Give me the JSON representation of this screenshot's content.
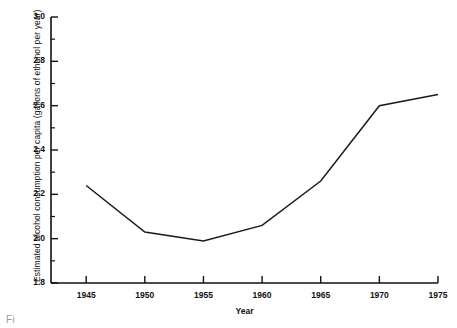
{
  "chart_data": {
    "type": "line",
    "title": "",
    "xlabel": "Year",
    "ylabel": "Estimated alcohol consumption per capita (gallons of ethanol per year)",
    "x": [
      1945,
      1950,
      1955,
      1960,
      1965,
      1970,
      1975
    ],
    "values": [
      2.24,
      2.03,
      1.99,
      2.06,
      2.26,
      2.6,
      2.65
    ],
    "xlim": [
      1942,
      1975
    ],
    "ylim": [
      1.8,
      3.0
    ],
    "xticks": [
      1945,
      1950,
      1955,
      1960,
      1965,
      1970,
      1975
    ],
    "xtick_labels": [
      "1945",
      "1950",
      "1955",
      "1960",
      "1965",
      "1970",
      "1975"
    ],
    "yticks": [
      1.8,
      2.0,
      2.2,
      2.4,
      2.6,
      2.8,
      3.0
    ],
    "ytick_labels": [
      "1.8",
      "2.0",
      "2.2",
      "2.4",
      "2.6",
      "2.8",
      "3.0"
    ],
    "y_minor_ticks": [
      1.9,
      2.1,
      2.3,
      2.5,
      2.7,
      2.9
    ],
    "grid": false,
    "legend": false,
    "line_color": "#1a1a1a",
    "axis_color": "#111111"
  },
  "caption": {
    "fragment": "Fi"
  }
}
